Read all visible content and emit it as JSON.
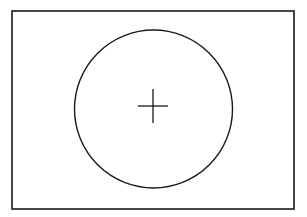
{
  "diagram": {
    "colors": {
      "background": "#ffffff",
      "stroke": "#1a1a1a"
    },
    "frame": {
      "x": 12,
      "y": 11,
      "width": 282,
      "height": 198,
      "stroke_width": 1.6
    },
    "circle": {
      "cx": 153.5,
      "cy": 109,
      "r": 79,
      "stroke_width": 1.4
    },
    "cross": {
      "cx": 153,
      "cy": 106,
      "half_width": 15,
      "half_height": 17,
      "stroke_width": 1.3
    }
  }
}
